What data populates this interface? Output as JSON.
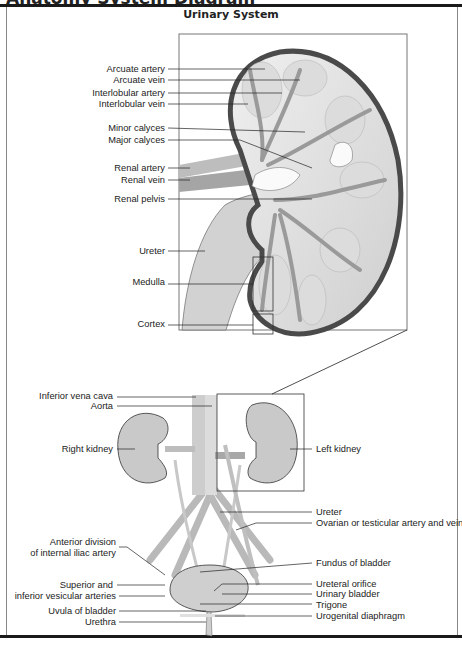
{
  "page": {
    "cut_heading": "Anatomy System Diagram",
    "title": "Urinary System"
  },
  "detail_view": {
    "caption": "Kidney cross-section (enlarged)",
    "labels": [
      {
        "id": "arcuate-artery",
        "text": "Arcuate artery"
      },
      {
        "id": "arcuate-vein",
        "text": "Arcuate vein"
      },
      {
        "id": "interlobular-artery",
        "text": "Interlobular artery"
      },
      {
        "id": "interlobular-vein",
        "text": "Interlobular vein"
      },
      {
        "id": "minor-calyces",
        "text": "Minor calyces"
      },
      {
        "id": "major-calyces",
        "text": "Major calyces"
      },
      {
        "id": "renal-artery",
        "text": "Renal artery"
      },
      {
        "id": "renal-vein",
        "text": "Renal vein"
      },
      {
        "id": "renal-pelvis",
        "text": "Renal pelvis"
      },
      {
        "id": "ureter-detail",
        "text": "Ureter"
      },
      {
        "id": "medulla",
        "text": "Medulla"
      },
      {
        "id": "cortex",
        "text": "Cortex"
      }
    ]
  },
  "overview": {
    "left_labels": [
      {
        "id": "inferior-vena-cava",
        "text": "Inferior vena cava"
      },
      {
        "id": "aorta",
        "text": "Aorta"
      },
      {
        "id": "right-kidney",
        "text": "Right kidney"
      },
      {
        "id": "anterior-division-1",
        "text": "Anterior division"
      },
      {
        "id": "anterior-division-2",
        "text": "of internal iliac artery"
      },
      {
        "id": "vesicular-1",
        "text": "Superior and"
      },
      {
        "id": "vesicular-2",
        "text": "inferior vesicular arteries"
      },
      {
        "id": "uvula",
        "text": "Uvula of bladder"
      },
      {
        "id": "urethra",
        "text": "Urethra"
      }
    ],
    "right_labels": [
      {
        "id": "left-kidney",
        "text": "Left kidney"
      },
      {
        "id": "ureter",
        "text": "Ureter"
      },
      {
        "id": "gonadal",
        "text": "Ovarian or testicular artery and vein"
      },
      {
        "id": "fundus",
        "text": "Fundus of bladder"
      },
      {
        "id": "ureteral-orifice",
        "text": "Ureteral orifice"
      },
      {
        "id": "urinary-bladder",
        "text": "Urinary bladder"
      },
      {
        "id": "trigone",
        "text": "Trigone"
      },
      {
        "id": "urogenital-diaphragm",
        "text": "Urogenital diaphragm"
      }
    ]
  },
  "colors": {
    "tissue": "#c9c9c9",
    "tissue_light": "#e4e4e4",
    "capsule": "#4a4a4a",
    "vessel": "#a8a8a8",
    "line": "#222222"
  }
}
